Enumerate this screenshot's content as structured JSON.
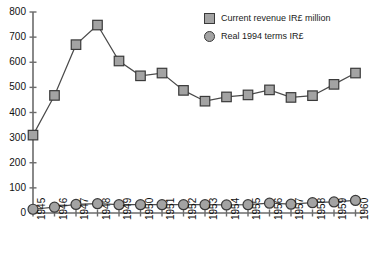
{
  "chart_data": {
    "type": "line",
    "title": "",
    "xlabel": "",
    "ylabel": "",
    "categories": [
      "1945",
      "1946",
      "1947",
      "1948",
      "1949",
      "1950",
      "1951",
      "1952",
      "1953",
      "1954",
      "1955",
      "1956",
      "1957",
      "1958",
      "1959",
      "1960"
    ],
    "ylim": [
      0,
      800
    ],
    "yticks": [
      0,
      100,
      200,
      300,
      400,
      500,
      600,
      700,
      800
    ],
    "grid": false,
    "legend_position": "top-right",
    "series": [
      {
        "name": "Current revenue IR£ million",
        "marker": "square",
        "color": "#a3a3a3",
        "values": [
          310,
          468,
          670,
          748,
          605,
          546,
          557,
          488,
          445,
          462,
          470,
          490,
          460,
          467,
          512,
          557
        ]
      },
      {
        "name": "Real 1994 terms IR£",
        "marker": "circle",
        "color": "#a3a3a3",
        "values": [
          15,
          23,
          34,
          37,
          33,
          33,
          33,
          33,
          33,
          32,
          33,
          39,
          35,
          41,
          44,
          50
        ]
      }
    ]
  },
  "legend": {
    "items": [
      {
        "label": "Current revenue IR£ million",
        "marker": "square"
      },
      {
        "label": "Real 1994 terms IR£",
        "marker": "circle"
      }
    ]
  },
  "colors": {
    "marker_fill": "#a3a3a3",
    "marker_stroke": "#3a3a3a",
    "line": "#4a4a4a",
    "axis": "#6b6b6b",
    "text": "#111111",
    "background": "#ffffff"
  }
}
